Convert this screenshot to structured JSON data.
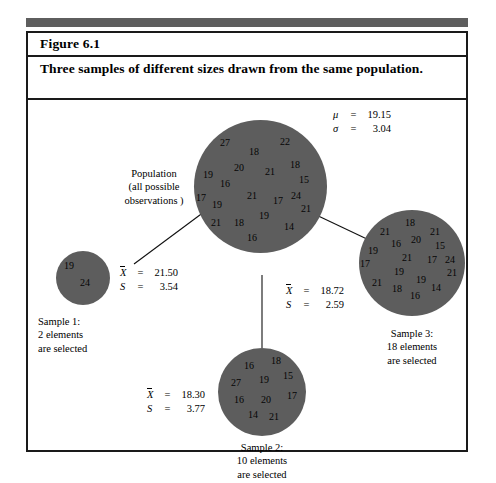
{
  "figure": {
    "label": "Figure 6.1",
    "caption": "Three samples of different sizes drawn from the same population."
  },
  "population": {
    "name": "Population",
    "sublabel_line1": "Population",
    "sublabel_line2": "(all possible",
    "sublabel_line3": "observations )",
    "mu_symbol": "μ",
    "mu_eq": "=",
    "mu_value": "19.15",
    "sigma_symbol": "σ",
    "sigma_eq": "=",
    "sigma_value": "3.04",
    "values": [
      {
        "v": "27",
        "x": 26,
        "y": 18
      },
      {
        "v": "18",
        "x": 55,
        "y": 27
      },
      {
        "v": "22",
        "x": 86,
        "y": 17
      },
      {
        "v": "20",
        "x": 40,
        "y": 43
      },
      {
        "v": "19",
        "x": 9,
        "y": 50
      },
      {
        "v": "21",
        "x": 71,
        "y": 47
      },
      {
        "v": "18",
        "x": 96,
        "y": 40
      },
      {
        "v": "16",
        "x": 26,
        "y": 59
      },
      {
        "v": "15",
        "x": 105,
        "y": 55
      },
      {
        "v": "17",
        "x": 2,
        "y": 73
      },
      {
        "v": "21",
        "x": 53,
        "y": 71
      },
      {
        "v": "17",
        "x": 79,
        "y": 76
      },
      {
        "v": "24",
        "x": 97,
        "y": 71
      },
      {
        "v": "19",
        "x": 18,
        "y": 80
      },
      {
        "v": "21",
        "x": 107,
        "y": 84
      },
      {
        "v": "19",
        "x": 65,
        "y": 91
      },
      {
        "v": "21",
        "x": 17,
        "y": 98
      },
      {
        "v": "18",
        "x": 40,
        "y": 98
      },
      {
        "v": "14",
        "x": 90,
        "y": 102
      },
      {
        "v": "16",
        "x": 53,
        "y": 113
      }
    ]
  },
  "sample1": {
    "title": "Sample 1:",
    "line2": "2 elements",
    "line3": "are selected",
    "mean_symbol": "X",
    "mean_eq": "=",
    "mean_value": "21.50",
    "sd_symbol": "S",
    "sd_eq": "=",
    "sd_value": "3.54",
    "values": [
      {
        "v": "19",
        "x": 8,
        "y": 10
      },
      {
        "v": "24",
        "x": 24,
        "y": 27
      }
    ]
  },
  "sample2": {
    "title": "Sample 2:",
    "line2": "10 elements",
    "line3": "are selected",
    "mean_symbol": "X",
    "mean_eq": "=",
    "mean_value": "18.30",
    "sd_symbol": "S",
    "sd_eq": "=",
    "sd_value": "3.77",
    "values": [
      {
        "v": "16",
        "x": 26,
        "y": 13
      },
      {
        "v": "18",
        "x": 53,
        "y": 8
      },
      {
        "v": "27",
        "x": 13,
        "y": 30
      },
      {
        "v": "19",
        "x": 41,
        "y": 27
      },
      {
        "v": "15",
        "x": 65,
        "y": 23
      },
      {
        "v": "16",
        "x": 16,
        "y": 47
      },
      {
        "v": "20",
        "x": 43,
        "y": 47
      },
      {
        "v": "17",
        "x": 69,
        "y": 43
      },
      {
        "v": "14",
        "x": 30,
        "y": 62
      },
      {
        "v": "21",
        "x": 51,
        "y": 64
      }
    ]
  },
  "sample3": {
    "title": "Sample 3:",
    "line2": "18 elements",
    "line3": "are selected",
    "mean_symbol": "X",
    "mean_eq": "=",
    "mean_value": "18.72",
    "sd_symbol": "S",
    "sd_eq": "=",
    "sd_value": "2.59",
    "values": [
      {
        "v": "18",
        "x": 46,
        "y": 8
      },
      {
        "v": "21",
        "x": 21,
        "y": 17
      },
      {
        "v": "21",
        "x": 71,
        "y": 17
      },
      {
        "v": "16",
        "x": 32,
        "y": 29
      },
      {
        "v": "20",
        "x": 52,
        "y": 25
      },
      {
        "v": "19",
        "x": 9,
        "y": 36
      },
      {
        "v": "15",
        "x": 76,
        "y": 31
      },
      {
        "v": "21",
        "x": 43,
        "y": 43
      },
      {
        "v": "17",
        "x": 1,
        "y": 49
      },
      {
        "v": "17",
        "x": 68,
        "y": 45
      },
      {
        "v": "24",
        "x": 86,
        "y": 45
      },
      {
        "v": "19",
        "x": 35,
        "y": 57
      },
      {
        "v": "21",
        "x": 88,
        "y": 58
      },
      {
        "v": "19",
        "x": 57,
        "y": 65
      },
      {
        "v": "21",
        "x": 13,
        "y": 68
      },
      {
        "v": "18",
        "x": 33,
        "y": 74
      },
      {
        "v": "14",
        "x": 72,
        "y": 73
      },
      {
        "v": "16",
        "x": 51,
        "y": 81
      }
    ]
  },
  "colors": {
    "circle_fill": "#5d5d5d",
    "rule": "#5e5e5e",
    "border": "#1a1a1a",
    "text": "#000000"
  }
}
